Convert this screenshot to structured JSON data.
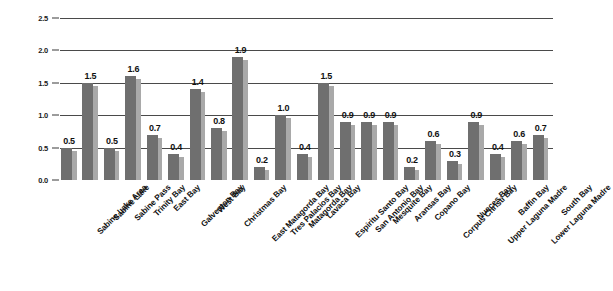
{
  "chart_data": {
    "type": "bar",
    "title": "",
    "subtitle": "",
    "xlabel": "",
    "ylabel": "",
    "ylim": [
      0.0,
      2.5
    ],
    "ytick_labels": [
      "0.0",
      "0.5",
      "1.0",
      "1.5",
      "2.0",
      "2.5"
    ],
    "ytick_values": [
      0.0,
      0.5,
      1.0,
      1.5,
      2.0,
      2.5
    ],
    "grid": true,
    "grid_axis": "y",
    "legend": false,
    "legend_position": "none",
    "data_labels": true,
    "bar_style": "3d-shadow",
    "categories": [
      "Sabine Lake Area",
      "Sabine Lake",
      "Sabine Pass",
      "Trinity Bay",
      "East Bay",
      "Galveston Bay",
      "West Bay",
      "Christmas Bay",
      "East Matagorda Bay",
      "Tres Palacios Bay",
      "Matagorda Bay",
      "Lavaca Bay",
      "Espiritu Santo Bay",
      "San Antonio Bay",
      "Mesquite Bay",
      "Aransas Bay",
      "Copano Bay",
      "Corpus Christi Bay",
      "Nueces Bay",
      "Upper Laguna Madre",
      "Baffin Bay",
      "Lower Laguna Madre",
      "South Bay"
    ],
    "values": [
      0.5,
      1.5,
      0.5,
      1.6,
      0.7,
      0.4,
      1.4,
      0.8,
      1.9,
      0.2,
      1.0,
      0.4,
      1.5,
      0.9,
      0.9,
      0.9,
      0.2,
      0.6,
      0.3,
      0.9,
      0.4,
      0.6,
      0.7
    ],
    "value_labels": [
      "0.5",
      "1.5",
      "0.5",
      "1.6",
      "0.7",
      "0.4",
      "1.4",
      "0.8",
      "1.9",
      "0.2",
      "1.0",
      "0.4",
      "1.5",
      "0.9",
      "0.9",
      "0.9",
      "0.2",
      "0.6",
      "0.3",
      "0.9",
      "0.4",
      "0.6",
      "0.7"
    ],
    "colors": {
      "bar_front": "#6f6f6f",
      "bar_side": "#a9a9a9",
      "gridline": "#4a4a4a",
      "text": "#111111",
      "background": "#ffffff"
    }
  }
}
